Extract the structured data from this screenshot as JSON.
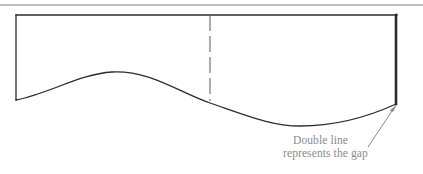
{
  "figure": {
    "title": "Double line represents the gap",
    "background_color": "#ffffff",
    "top_rule": {
      "name": "horizontal-divider-rule",
      "color": "#a9a9a9",
      "y": 5,
      "x1": 0,
      "x2": 423,
      "thickness": 1.6
    },
    "outline": {
      "stroke_color": "#2b2b2b",
      "thin_stroke_width": 1.1,
      "gap_stroke_width": 2.6,
      "top_edge": {
        "x1": 16,
        "y1": 15,
        "x2": 397,
        "y2": 15
      },
      "left_edge": {
        "x1": 16,
        "y1": 15,
        "x2": 16,
        "y2": 100
      },
      "right_edge_double": {
        "x1": 396,
        "y1": 15,
        "x2": 396,
        "y2": 104
      }
    },
    "dashed_divider": {
      "name": "dashed-center-line",
      "color": "#6a6a6a",
      "x": 210,
      "y_top": 15,
      "y_bottom": 101,
      "dash_pattern": "16 5",
      "thickness": 1.1
    },
    "wave_curve": {
      "name": "wave-profile-curve",
      "color": "#2b2b2b",
      "thickness": 1.3,
      "start": {
        "x": 16,
        "y": 100
      },
      "crest": {
        "x": 112,
        "y": 72
      },
      "trough": {
        "x": 300,
        "y": 126
      },
      "end": {
        "x": 396,
        "y": 104
      },
      "path": "M 16 100 C 48 94 80 74 112 72 C 150 70 178 92 210 103 C 248 116 272 126 300 126 C 338 126 372 115 396 104"
    },
    "leader_arrow": {
      "name": "leader-arrow",
      "color": "#8b8b8b",
      "thickness": 1.0,
      "tail": {
        "x": 368,
        "y": 147
      },
      "head": {
        "x": 396,
        "y": 106
      }
    }
  },
  "annotations": {
    "caption": {
      "line_1": "Double line",
      "line_2": "represents the gap",
      "color": "#8b8b8b"
    }
  }
}
